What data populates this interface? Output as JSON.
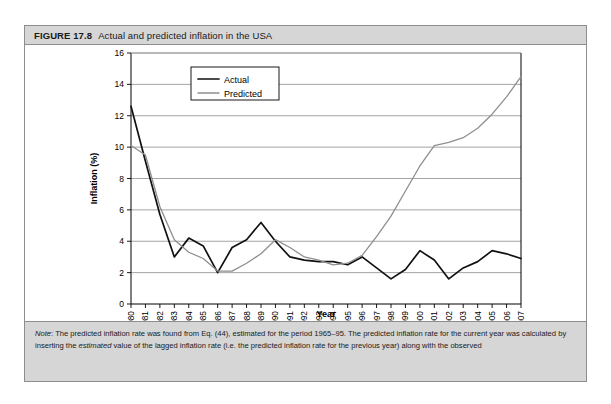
{
  "figure": {
    "number": "FIGURE 17.8",
    "title": "Actual and predicted inflation in the USA",
    "note_label": "Note",
    "note_text_1": ": The predicted inflation rate was found from Eq. (44), estimated for the period 1965–95. The predicted inflation rate for the current year was",
    "note_text_2a": "calculated by inserting the ",
    "note_text_2b": "estimated",
    "note_text_2c": " value of the lagged inflation rate (i.e. the predicted inflation rate for the previous year) along with the observed"
  },
  "colors": {
    "actual": "#111111",
    "predicted": "#8f8f8f",
    "header_bg": "#d6d6d6",
    "border": "#8d8d8d",
    "grid": "#9a9a9a"
  },
  "legend": {
    "items": [
      {
        "label": "Actual",
        "key": "actual"
      },
      {
        "label": "Predicted",
        "key": "predicted"
      }
    ]
  },
  "chart_data": {
    "type": "line",
    "title": "Actual and predicted inflation in the USA",
    "xlabel": "Year",
    "ylabel": "Inflation (%)",
    "ylim": [
      0,
      16
    ],
    "ytick_step": 2,
    "yticks": [
      0,
      2,
      4,
      6,
      8,
      10,
      12,
      14,
      16
    ],
    "grid": true,
    "legend_position": "top-left-inside",
    "categories": [
      "1980",
      "1981",
      "1982",
      "1983",
      "1984",
      "1985",
      "1986",
      "1987",
      "1988",
      "1989",
      "1990",
      "1991",
      "1992",
      "1993",
      "1994",
      "1995",
      "1996",
      "1997",
      "1998",
      "1999",
      "2000",
      "2001",
      "2002",
      "2003",
      "2004",
      "2005",
      "2006",
      "2007"
    ],
    "series": [
      {
        "name": "Actual",
        "values": [
          12.6,
          9.1,
          5.7,
          3.0,
          4.2,
          3.7,
          2.0,
          3.6,
          4.1,
          5.2,
          4.0,
          3.0,
          2.8,
          2.7,
          2.7,
          2.5,
          3.0,
          2.3,
          1.6,
          2.2,
          3.4,
          2.8,
          1.6,
          2.3,
          2.7,
          3.4,
          3.2,
          2.9
        ]
      },
      {
        "name": "Predicted",
        "values": [
          10.1,
          9.5,
          6.2,
          4.1,
          3.3,
          2.9,
          2.1,
          2.1,
          2.6,
          3.2,
          4.1,
          3.6,
          3.0,
          2.8,
          2.5,
          2.6,
          3.1,
          4.3,
          5.6,
          7.2,
          8.8,
          10.1,
          10.3,
          10.6,
          11.2,
          12.1,
          13.2,
          14.5
        ]
      }
    ]
  }
}
